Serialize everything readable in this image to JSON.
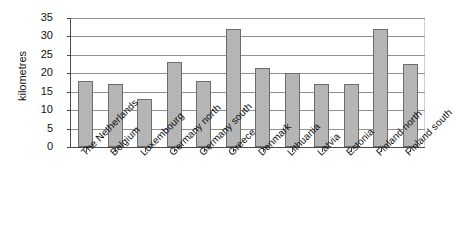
{
  "chart_data": {
    "type": "bar",
    "title": "",
    "xlabel": "",
    "ylabel": "kilometres",
    "ylim": [
      0,
      35
    ],
    "yticks": [
      0,
      5,
      10,
      15,
      20,
      25,
      30,
      35
    ],
    "ytick_labels": [
      "0",
      "5",
      "10",
      "15",
      "20",
      "25",
      "30",
      "35"
    ],
    "grid": "horizontal",
    "legend": "none",
    "bar_color": "#b5b5b5",
    "bar_border_color": "#6d6d6d",
    "axis_color": "#4a4a4a",
    "gridline_color": "#8f8f8f",
    "categories": [
      "The Netherlands",
      "Belgium",
      "Luxembourg",
      "Germany north",
      "Germany south",
      "Greece",
      "Denmark",
      "Lithuania",
      "Latvia",
      "Estonia",
      "Finland north",
      "Finland south"
    ],
    "values": [
      18,
      17,
      13,
      23,
      18,
      32,
      21.5,
      20,
      17,
      17,
      32,
      22.5
    ]
  }
}
